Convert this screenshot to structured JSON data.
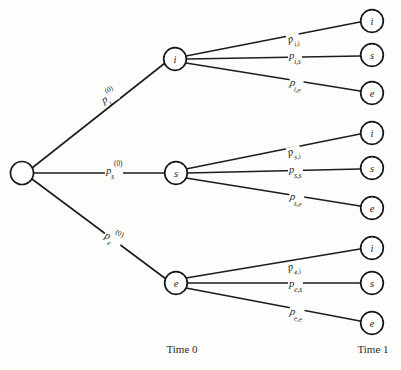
{
  "diagram": {
    "background_color": "#fdfdfc",
    "line_color": "#1d1d1d",
    "node_fill": "#ffffff",
    "root": {
      "label": ""
    },
    "time_axis": {
      "time0_label": "Time 0",
      "time1_label": "Time 1"
    },
    "level1_nodes": [
      {
        "id": "i",
        "label": "i"
      },
      {
        "id": "s",
        "label": "s"
      },
      {
        "id": "e",
        "label": "e"
      }
    ],
    "level1_edge_labels": [
      {
        "base": "p",
        "sub": "i",
        "sup": "(0)"
      },
      {
        "base": "p",
        "sub": "s",
        "sup": "(0)"
      },
      {
        "base": "p",
        "sub": "e",
        "sup": "(0)"
      }
    ],
    "level2_groups": [
      {
        "parent": "i",
        "edges": [
          {
            "base": "p",
            "sub": "i,i",
            "target": "i"
          },
          {
            "base": "p",
            "sub": "i,s",
            "target": "s"
          },
          {
            "base": "p",
            "sub": "i,e",
            "target": "e"
          }
        ]
      },
      {
        "parent": "s",
        "edges": [
          {
            "base": "p",
            "sub": "s,i",
            "target": "i"
          },
          {
            "base": "p",
            "sub": "s,s",
            "target": "s"
          },
          {
            "base": "p",
            "sub": "s,e",
            "target": "e"
          }
        ]
      },
      {
        "parent": "e",
        "edges": [
          {
            "base": "p",
            "sub": "e,i",
            "target": "i"
          },
          {
            "base": "p",
            "sub": "e,s",
            "target": "s"
          },
          {
            "base": "p",
            "sub": "e,e",
            "target": "e"
          }
        ]
      }
    ],
    "leaf_nodes": [
      {
        "label": "i"
      },
      {
        "label": "s"
      },
      {
        "label": "e"
      },
      {
        "label": "i"
      },
      {
        "label": "s"
      },
      {
        "label": "e"
      },
      {
        "label": "i"
      },
      {
        "label": "s"
      },
      {
        "label": "e"
      }
    ]
  }
}
